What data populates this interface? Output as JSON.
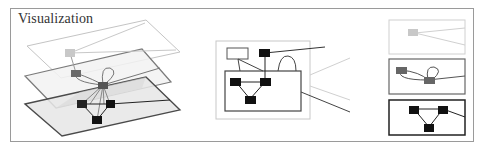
{
  "panel": {
    "title": "Visualization"
  },
  "colors": {
    "frame": "#9a9a9a",
    "layer_top": "#c8c8c8",
    "layer_mid": "#777777",
    "layer_bottom": "#4a4a4a",
    "node_top": "#c8c8c8",
    "node_mid": "#6a6a6a",
    "node_bottom": "#111111"
  },
  "diagram": {
    "views": [
      {
        "name": "stacked-layers-3d",
        "layers": [
          "top",
          "middle",
          "bottom"
        ]
      },
      {
        "name": "zoomed-cross-section"
      },
      {
        "name": "separated-layers",
        "layers": [
          "top",
          "middle",
          "bottom"
        ]
      }
    ]
  }
}
